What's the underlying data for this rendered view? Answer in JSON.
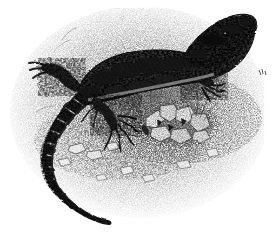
{
  "image": {
    "domain": "Natural-Image",
    "kind": "vintage-engraving",
    "title": "Lizard, vintage engraved illustration",
    "subject": "lizard",
    "technique": "stipple and crosshatch engraving",
    "palette": {
      "background": "#ffffff",
      "ink": "#1a1a1a",
      "ink_mid": "#555555",
      "ink_light": "#8d8d8d",
      "ground_tint": "#b8b8b8"
    },
    "canvas": {
      "width": 272,
      "height": 236
    },
    "composition": {
      "ground_patch": "irregular stippled oval occupying most of the frame, fading to white at the edges",
      "ground_center_x": 140,
      "ground_center_y": 120,
      "ground_radius_x": 128,
      "ground_radius_y": 110
    },
    "subject_parts": [
      {
        "name": "head",
        "x": 212,
        "y": 34,
        "note": "raised, pointed snout facing upper right, heavily mottled dark scales"
      },
      {
        "name": "neck",
        "x": 186,
        "y": 55,
        "note": "short, speckled"
      },
      {
        "name": "trunk",
        "x": 140,
        "y": 62,
        "note": "broad flattened body with dark blotchy dorsal pattern"
      },
      {
        "name": "fore-limb-right",
        "x": 196,
        "y": 74,
        "note": "bent forelimb with splayed clawed toes"
      },
      {
        "name": "fore-limb-left",
        "x": 112,
        "y": 118,
        "note": "forelimb reaching down-left with long clawed digits"
      },
      {
        "name": "hind-limb-left",
        "x": 58,
        "y": 70,
        "note": "hind limb and foot at upper left of hips"
      },
      {
        "name": "hips",
        "x": 76,
        "y": 88,
        "note": "pelvic region where tail begins"
      },
      {
        "name": "tail",
        "x": 60,
        "y": 150,
        "note": "long banded tail sweeping left, curving down and hooking right"
      },
      {
        "name": "tail-tip",
        "x": 104,
        "y": 222,
        "note": "thin tapering tip pointing right"
      }
    ],
    "scene_elements": [
      {
        "name": "pebble-cluster",
        "x": 168,
        "y": 120,
        "note": "bright angular stones with dark shadowed crevices"
      },
      {
        "name": "small-stones",
        "x": 86,
        "y": 150,
        "note": "scattered flat pebbles left of centre"
      },
      {
        "name": "grass-tufts",
        "x": 196,
        "y": 104,
        "note": "sparse fine lines suggesting dry vegetation"
      },
      {
        "name": "cast-shadow",
        "x": 150,
        "y": 96,
        "note": "soft shadow under the body on the ground"
      },
      {
        "name": "stray-mark",
        "x": 262,
        "y": 72,
        "note": "small isolated ink flick at right margin"
      }
    ],
    "labels": {
      "none_visible": ""
    }
  }
}
